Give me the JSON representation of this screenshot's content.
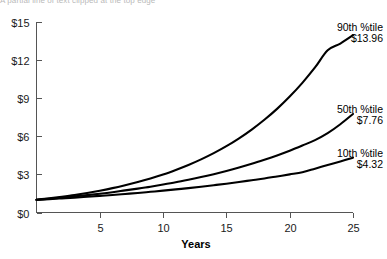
{
  "clipped_header": "A partial line of text clipped at the top edge",
  "chart_data": {
    "type": "line",
    "title": "",
    "xlabel": "Years",
    "ylabel": "",
    "xlim": [
      0,
      25
    ],
    "ylim": [
      0,
      15
    ],
    "grid": false,
    "legend_position": "inline-right-annotations",
    "x_ticks": [
      5,
      10,
      15,
      20,
      25
    ],
    "x_tick_labels": [
      "5",
      "10",
      "15",
      "20",
      "25"
    ],
    "y_ticks": [
      0,
      3,
      6,
      9,
      12,
      15
    ],
    "y_tick_labels": [
      "$0",
      "$3",
      "$6",
      "$9",
      "$12",
      "$15"
    ],
    "x": [
      0,
      1,
      2,
      3,
      4,
      5,
      6,
      7,
      8,
      9,
      10,
      11,
      12,
      13,
      14,
      15,
      16,
      17,
      18,
      19,
      20,
      21,
      22,
      23,
      24,
      25
    ],
    "series": [
      {
        "name": "90th %tile",
        "end_value": 13.96,
        "end_label": "$13.96",
        "annotation_line1": "90th %tile",
        "annotation_line2": "$13.96",
        "color": "#000000",
        "values": [
          1.0,
          1.11,
          1.24,
          1.38,
          1.54,
          1.72,
          1.92,
          2.15,
          2.4,
          2.68,
          2.99,
          3.35,
          3.74,
          4.18,
          4.67,
          5.22,
          5.84,
          6.53,
          7.3,
          8.16,
          9.13,
          10.21,
          11.42,
          12.77,
          13.3,
          13.96
        ]
      },
      {
        "name": "50th %tile",
        "end_value": 7.76,
        "end_label": "$7.76",
        "annotation_line1": "50th %tile",
        "annotation_line2": "$7.76",
        "color": "#000000",
        "values": [
          1.0,
          1.08,
          1.17,
          1.27,
          1.37,
          1.48,
          1.6,
          1.74,
          1.88,
          2.03,
          2.2,
          2.38,
          2.58,
          2.79,
          3.02,
          3.27,
          3.54,
          3.83,
          4.15,
          4.49,
          4.86,
          5.27,
          5.7,
          6.25,
          6.95,
          7.76
        ]
      },
      {
        "name": "10th %tile",
        "end_value": 4.32,
        "end_label": "$4.32",
        "annotation_line1": "10th %tile",
        "annotation_line2": "$4.32",
        "color": "#000000",
        "values": [
          1.0,
          1.05,
          1.11,
          1.17,
          1.24,
          1.31,
          1.38,
          1.46,
          1.54,
          1.63,
          1.72,
          1.82,
          1.92,
          2.03,
          2.15,
          2.27,
          2.4,
          2.54,
          2.68,
          2.84,
          3.0,
          3.17,
          3.45,
          3.74,
          4.02,
          4.32
        ]
      }
    ]
  },
  "axis": {
    "x_title": "Years"
  }
}
